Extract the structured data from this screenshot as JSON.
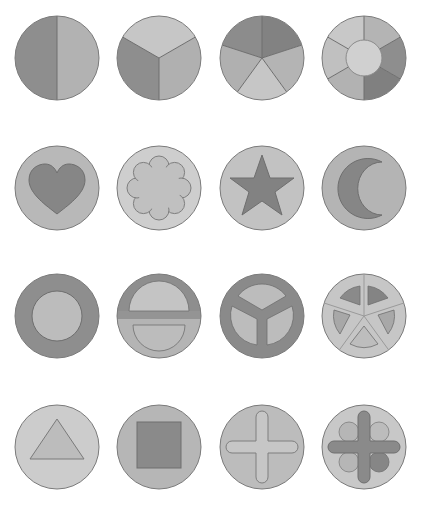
{
  "colors": {
    "background": "#ffffff",
    "dark": "#8c8c8c",
    "mid": "#a8a8a8",
    "light": "#c4c4c4",
    "lighter": "#d2d2d2",
    "stroke": "#7a7a7a"
  },
  "grid": {
    "columns_x": [
      57,
      159,
      262,
      364
    ],
    "rows_y": [
      58,
      188,
      316,
      447
    ],
    "radius": 42
  },
  "tokens": [
    {
      "row": 0,
      "col": 0,
      "name": "halves",
      "description": "circle split vertically in two halves"
    },
    {
      "row": 0,
      "col": 1,
      "name": "thirds",
      "description": "circle split into three sectors"
    },
    {
      "row": 0,
      "col": 2,
      "name": "fifths",
      "description": "circle split into five sectors"
    },
    {
      "row": 0,
      "col": 3,
      "name": "ring-sixths",
      "description": "ring of six sectors around a center disc"
    },
    {
      "row": 1,
      "col": 0,
      "name": "heart",
      "description": "heart inlay"
    },
    {
      "row": 1,
      "col": 1,
      "name": "flower",
      "description": "scalloped flower inlay"
    },
    {
      "row": 1,
      "col": 2,
      "name": "star",
      "description": "five-point star inlay"
    },
    {
      "row": 1,
      "col": 3,
      "name": "crescent",
      "description": "crescent moon inlay"
    },
    {
      "row": 2,
      "col": 0,
      "name": "ring",
      "description": "thick ring with inner disc"
    },
    {
      "row": 2,
      "col": 1,
      "name": "split-bar",
      "description": "two half discs separated by a bar"
    },
    {
      "row": 2,
      "col": 2,
      "name": "three-spoke",
      "description": "three spokes with inner sectors"
    },
    {
      "row": 2,
      "col": 3,
      "name": "five-spoke",
      "description": "five spokes with inner sectors"
    },
    {
      "row": 3,
      "col": 0,
      "name": "triangle",
      "description": "triangle inlay"
    },
    {
      "row": 3,
      "col": 1,
      "name": "square",
      "description": "square inlay"
    },
    {
      "row": 3,
      "col": 2,
      "name": "cross",
      "description": "rounded plus inlay"
    },
    {
      "row": 3,
      "col": 3,
      "name": "cross-dots",
      "description": "rounded plus with four discs"
    }
  ]
}
